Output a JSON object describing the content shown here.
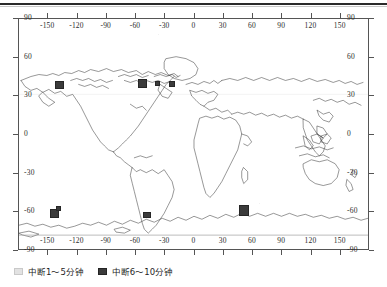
{
  "figure": {
    "frame": {
      "x": 18,
      "y": 18,
      "width": 351,
      "height": 232
    }
  },
  "chart_data": {
    "type": "scatter",
    "title": "",
    "subtitle": "",
    "xlabel": "",
    "ylabel": "",
    "projection": "equirectangular world map",
    "grid": false,
    "legend_position": "below-left",
    "xlim": [
      -180,
      180
    ],
    "ylim": [
      -90,
      90
    ],
    "x_ticks": [
      -150,
      -120,
      -90,
      -60,
      -30,
      0,
      30,
      60,
      90,
      120,
      150
    ],
    "y_ticks": [
      90,
      60,
      30,
      0,
      -30,
      -60,
      -90
    ],
    "x_tick_labels": [
      "-150",
      "-120",
      "-90",
      "-60",
      "-30",
      "0",
      "30",
      "60",
      "90",
      "120",
      "150"
    ],
    "y_tick_labels": [
      "90",
      "60",
      "30",
      "0",
      "-30",
      "-60",
      "-90"
    ],
    "axes_mirrored": true,
    "series": [
      {
        "name": "中断1～5分钟",
        "marker": "square",
        "color": "#e2e2e2",
        "points": []
      },
      {
        "name": "中断6～10分钟",
        "marker": "square",
        "color": "#3b3b3b",
        "points": [
          {
            "lon": -126,
            "lat": 62,
            "size": 9
          },
          {
            "lon": -57,
            "lat": 60,
            "size": 9
          },
          {
            "lon": -40,
            "lat": 61,
            "size": 5
          },
          {
            "lon": -25,
            "lat": 60,
            "size": 6
          },
          {
            "lon": -142,
            "lat": -60,
            "size": 9
          },
          {
            "lon": -52,
            "lat": -63,
            "size": 7
          },
          {
            "lon": 57,
            "lat": -60,
            "size": 10
          }
        ]
      }
    ]
  },
  "legend": {
    "entries": [
      {
        "swatch": "light-square-swatch",
        "label": "中断1～5分钟"
      },
      {
        "swatch": "dark-square-swatch",
        "label": "中断6～10分钟"
      }
    ]
  }
}
